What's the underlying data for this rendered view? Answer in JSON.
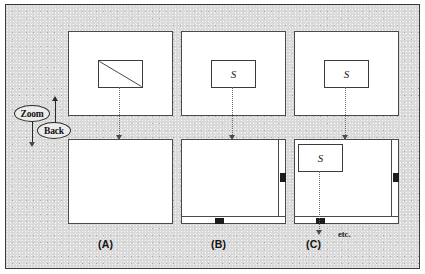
{
  "figure": {
    "background_color": "#d9d9d9",
    "frame_color": "#3a3a3a",
    "panel_fill": "#ffffff",
    "ink_color": "#2b2b2b",
    "thumb_color": "#1b1b1b"
  },
  "controls": {
    "zoom_label": "Zoom",
    "back_label": "Back"
  },
  "columns": [
    {
      "caption": "(A)",
      "top": {
        "inner_label": "",
        "inner_kind": "diagonal-rectangle",
        "has_inner": true
      },
      "bottom": {
        "inner_label": "",
        "has_inner": false,
        "scrollbars": {
          "vertical": false,
          "horizontal": false
        }
      }
    },
    {
      "caption": "(B)",
      "top": {
        "inner_label": "S",
        "inner_kind": "labeled-rectangle",
        "has_inner": true
      },
      "bottom": {
        "inner_label": "",
        "has_inner": false,
        "scrollbars": {
          "vertical": true,
          "horizontal": true
        }
      }
    },
    {
      "caption": "(C)",
      "top": {
        "inner_label": "S",
        "inner_kind": "labeled-rectangle",
        "has_inner": true
      },
      "bottom": {
        "inner_label": "S",
        "has_inner": true,
        "scrollbars": {
          "vertical": true,
          "horizontal": true
        }
      }
    }
  ],
  "annotations": {
    "etc_label": "etc."
  }
}
